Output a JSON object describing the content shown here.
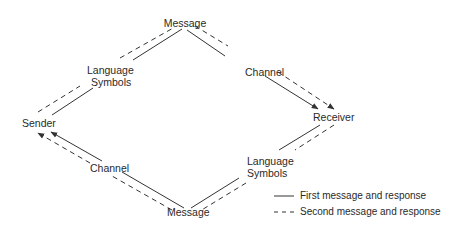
{
  "diagram": {
    "nodes": {
      "message_top": "Message",
      "sender": "Sender",
      "receiver": "Receiver",
      "message_bottom": "Message",
      "language_symbols_top": [
        "Language",
        "Symbols"
      ],
      "language_symbols_bottom": [
        "Language",
        "Symbols"
      ],
      "channel_top": "Channel",
      "channel_bottom": "Channel"
    },
    "legend": {
      "solid_label": "First message and response",
      "dashed_label": "Second message and response"
    },
    "colors": {
      "line": "#333333",
      "background": "#ffffff"
    }
  }
}
